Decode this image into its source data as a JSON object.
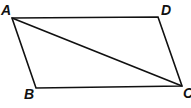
{
  "figure": {
    "type": "parallelogram",
    "stroke_color": "#111111",
    "vertices": {
      "A": {
        "label": "A",
        "x": 12,
        "y": 18
      },
      "D": {
        "label": "D",
        "x": 158,
        "y": 17
      },
      "C": {
        "label": "C",
        "x": 182,
        "y": 86
      },
      "B": {
        "label": "B",
        "x": 36,
        "y": 88
      }
    },
    "diagonal": {
      "from": "A",
      "to": "C"
    }
  }
}
